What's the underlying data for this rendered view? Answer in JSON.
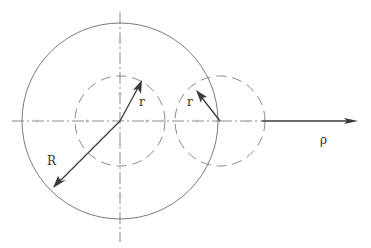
{
  "diagram": {
    "labels": {
      "big_radius": "R",
      "small_radius_left": "r",
      "small_radius_right": "r",
      "axis": "ρ"
    },
    "colors": {
      "line": "#7a7a7a",
      "arrow": "#3a3a3a",
      "text": "#333333"
    },
    "geometry": {
      "big_circle": {
        "cx": 120,
        "cy": 121,
        "r": 98,
        "style": "solid"
      },
      "small_circle_center": {
        "cx": 120,
        "cy": 121,
        "r": 45,
        "style": "dashed"
      },
      "small_circle_right": {
        "cx": 220,
        "cy": 121,
        "r": 45,
        "style": "dashed"
      },
      "rho_axis": {
        "x1": 12,
        "x2": 358,
        "y": 121
      },
      "vertical_axis": {
        "x": 120,
        "y1": 12,
        "y2": 242
      }
    }
  }
}
